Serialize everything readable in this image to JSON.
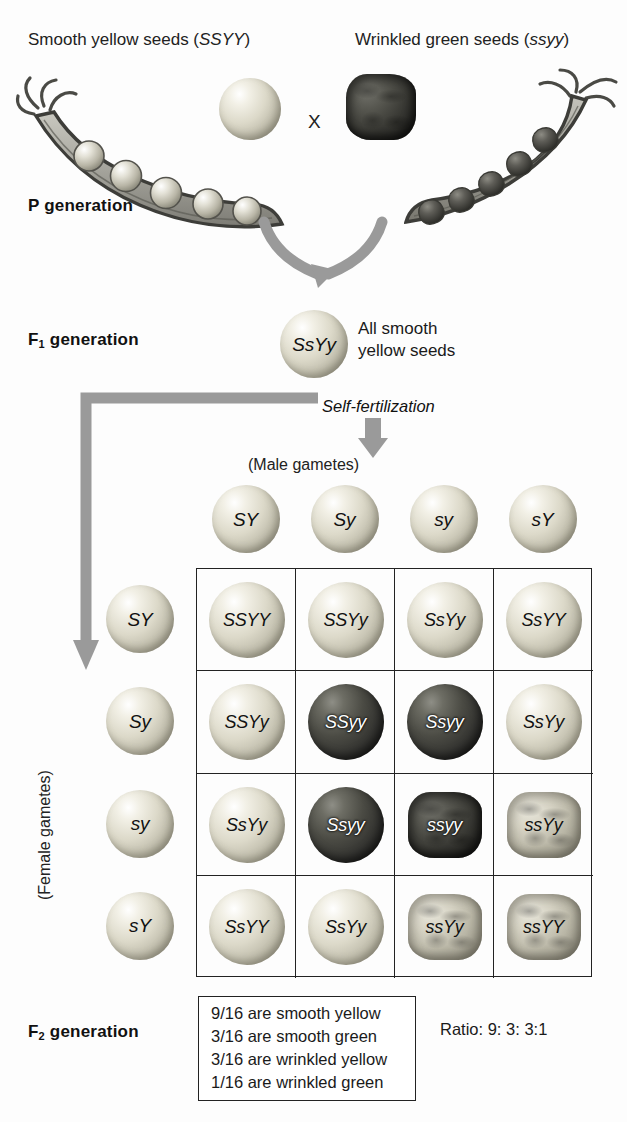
{
  "header": {
    "left_parent_label": "Smooth yellow seeds (",
    "left_parent_genotype": "SSYY",
    "left_parent_label_end": ")",
    "right_parent_label": "Wrinkled green seeds (",
    "right_parent_genotype": "ssyy",
    "right_parent_label_end": ")",
    "cross_symbol": "X"
  },
  "generations": {
    "p_label": "P generation",
    "p_label_main": "P",
    "p_label_rest": " generation",
    "f1_label_main": "F",
    "f1_label_sub": "1",
    "f1_label_rest": " generation",
    "f1_genotype": "SsYy",
    "f1_phenotype_line1": "All smooth",
    "f1_phenotype_line2": "yellow seeds",
    "self_fertilization": "Self-fertilization",
    "f2_label_main": "F",
    "f2_label_sub": "2",
    "f2_label_rest": " generation"
  },
  "axes": {
    "male_gametes": "(Male gametes)",
    "female_gametes": "(Female gametes)"
  },
  "gametes": {
    "male": [
      "SY",
      "Sy",
      "sy",
      "sY"
    ],
    "female": [
      "SY",
      "Sy",
      "sy",
      "sY"
    ]
  },
  "punnett": {
    "rows": [
      [
        {
          "genotype": "SSYY",
          "phenotype": "smooth-yellow"
        },
        {
          "genotype": "SSYy",
          "phenotype": "smooth-yellow"
        },
        {
          "genotype": "SsYy",
          "phenotype": "smooth-yellow"
        },
        {
          "genotype": "SsYY",
          "phenotype": "smooth-yellow"
        }
      ],
      [
        {
          "genotype": "SSYy",
          "phenotype": "smooth-yellow"
        },
        {
          "genotype": "SSyy",
          "phenotype": "smooth-green"
        },
        {
          "genotype": "Ssyy",
          "phenotype": "smooth-green"
        },
        {
          "genotype": "SsYy",
          "phenotype": "smooth-yellow"
        }
      ],
      [
        {
          "genotype": "SsYy",
          "phenotype": "smooth-yellow"
        },
        {
          "genotype": "Ssyy",
          "phenotype": "smooth-green"
        },
        {
          "genotype": "ssyy",
          "phenotype": "wrinkled-green"
        },
        {
          "genotype": "ssYy",
          "phenotype": "wrinkled-yellow"
        }
      ],
      [
        {
          "genotype": "SsYY",
          "phenotype": "smooth-yellow"
        },
        {
          "genotype": "SsYy",
          "phenotype": "smooth-yellow"
        },
        {
          "genotype": "ssYy",
          "phenotype": "wrinkled-yellow"
        },
        {
          "genotype": "ssYY",
          "phenotype": "wrinkled-yellow"
        }
      ]
    ]
  },
  "results": {
    "lines": [
      "9/16 are smooth yellow",
      "3/16 are smooth green",
      "3/16 are wrinkled yellow",
      "1/16 are wrinkled green"
    ],
    "ratio": "Ratio: 9: 3: 3:1"
  },
  "colors": {
    "ink": "#1a1a1a",
    "rule": "#222222",
    "arrow": "#9a9a9a",
    "yellow_seed": "#dcd9c9",
    "green_seed": "#3a3a35"
  },
  "chart_data": {
    "type": "table",
    "categories": [
      "SY",
      "Sy",
      "sy",
      "sY"
    ],
    "phenotype_counts": {
      "smooth yellow": 9,
      "smooth green": 3,
      "wrinkled yellow": 3,
      "wrinkled green": 1
    },
    "ratio": [
      9,
      3,
      3,
      1
    ]
  }
}
